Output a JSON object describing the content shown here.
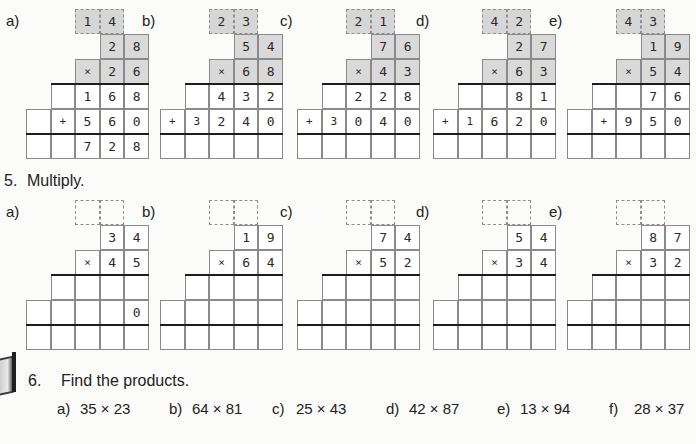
{
  "section4": {
    "problems": [
      {
        "label": "a)",
        "carry": [
          "1",
          "4"
        ],
        "top": [
          "2",
          "8"
        ],
        "mult": [
          "×",
          "2",
          "6"
        ],
        "p1": [
          "",
          "",
          "1",
          "6",
          "8"
        ],
        "p2": [
          "",
          "+",
          "5",
          "6",
          "0"
        ],
        "sum": [
          "",
          "",
          "7",
          "2",
          "8"
        ]
      },
      {
        "label": "b)",
        "carry": [
          "2",
          "3"
        ],
        "top": [
          "5",
          "4"
        ],
        "mult": [
          "×",
          "6",
          "8"
        ],
        "p1": [
          "",
          "",
          "4",
          "3",
          "2"
        ],
        "p2": [
          "+",
          "3",
          "2",
          "4",
          "0"
        ],
        "sum": [
          "",
          "",
          "",
          "",
          ""
        ]
      },
      {
        "label": "c)",
        "carry": [
          "2",
          "1"
        ],
        "top": [
          "7",
          "6"
        ],
        "mult": [
          "×",
          "4",
          "3"
        ],
        "p1": [
          "",
          "",
          "2",
          "2",
          "8"
        ],
        "p2": [
          "+",
          "3",
          "0",
          "4",
          "0"
        ],
        "sum": [
          "",
          "",
          "",
          "",
          ""
        ]
      },
      {
        "label": "d)",
        "carry": [
          "4",
          "2"
        ],
        "top": [
          "2",
          "7"
        ],
        "mult": [
          "×",
          "6",
          "3"
        ],
        "p1": [
          "",
          "",
          "",
          "8",
          "1"
        ],
        "p2": [
          "+",
          "1",
          "6",
          "2",
          "0"
        ],
        "sum": [
          "",
          "",
          "",
          "",
          ""
        ]
      },
      {
        "label": "e)",
        "carry": [
          "4",
          "3"
        ],
        "top": [
          "1",
          "9"
        ],
        "mult": [
          "×",
          "5",
          "4"
        ],
        "p1": [
          "",
          "",
          "",
          "7",
          "6"
        ],
        "p2": [
          "",
          "+",
          "9",
          "5",
          "0"
        ],
        "sum": [
          "",
          "",
          "",
          "",
          ""
        ]
      }
    ]
  },
  "section5": {
    "number": "5.",
    "title": "Multiply.",
    "problems": [
      {
        "label": "a)",
        "carry": [
          "",
          ""
        ],
        "top": [
          "3",
          "4"
        ],
        "mult": [
          "×",
          "4",
          "5"
        ],
        "p1": [
          "",
          "",
          "",
          "",
          ""
        ],
        "p2": [
          "",
          "",
          "",
          "",
          "0"
        ],
        "sum": [
          "",
          "",
          "",
          "",
          ""
        ]
      },
      {
        "label": "b)",
        "carry": [
          "",
          ""
        ],
        "top": [
          "1",
          "9"
        ],
        "mult": [
          "×",
          "6",
          "4"
        ],
        "p1": [
          "",
          "",
          "",
          "",
          ""
        ],
        "p2": [
          "",
          "",
          "",
          "",
          ""
        ],
        "sum": [
          "",
          "",
          "",
          "",
          ""
        ]
      },
      {
        "label": "c)",
        "carry": [
          "",
          ""
        ],
        "top": [
          "7",
          "4"
        ],
        "mult": [
          "×",
          "5",
          "2"
        ],
        "p1": [
          "",
          "",
          "",
          "",
          ""
        ],
        "p2": [
          "",
          "",
          "",
          "",
          ""
        ],
        "sum": [
          "",
          "",
          "",
          "",
          ""
        ]
      },
      {
        "label": "d)",
        "carry": [
          "",
          ""
        ],
        "top": [
          "5",
          "4"
        ],
        "mult": [
          "×",
          "3",
          "4"
        ],
        "p1": [
          "",
          "",
          "",
          "",
          ""
        ],
        "p2": [
          "",
          "",
          "",
          "",
          ""
        ],
        "sum": [
          "",
          "",
          "",
          "",
          ""
        ]
      },
      {
        "label": "e)",
        "carry": [
          "",
          ""
        ],
        "top": [
          "8",
          "7"
        ],
        "mult": [
          "×",
          "3",
          "2"
        ],
        "p1": [
          "",
          "",
          "",
          "",
          ""
        ],
        "p2": [
          "",
          "",
          "",
          "",
          ""
        ],
        "sum": [
          "",
          "",
          "",
          "",
          ""
        ]
      }
    ]
  },
  "section6": {
    "number": "6.",
    "title": "Find the products.",
    "icon": "book-icon",
    "problems": [
      {
        "label": "a)",
        "expr": "35 × 23"
      },
      {
        "label": "b)",
        "expr": "64 × 81"
      },
      {
        "label": "c)",
        "expr": "25 × 43"
      },
      {
        "label": "d)",
        "expr": "42 × 87"
      },
      {
        "label": "e)",
        "expr": "13 × 94"
      },
      {
        "label": "f)",
        "expr": "28 × 37"
      }
    ]
  }
}
